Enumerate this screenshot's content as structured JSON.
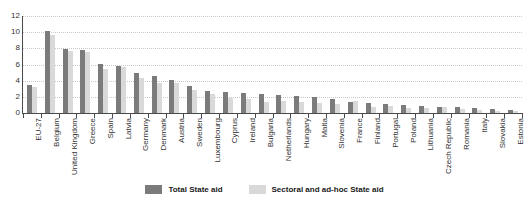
{
  "chart_data": {
    "type": "bar",
    "title": "",
    "xlabel": "",
    "ylabel": "",
    "ylim": [
      0,
      12
    ],
    "yticks": [
      0,
      2,
      4,
      6,
      8,
      10,
      12
    ],
    "grid": true,
    "legend_position": "bottom-center",
    "categories": [
      "EU-27",
      "Belgium",
      "United Kingdom",
      "Greece",
      "Spain",
      "Latvia",
      "Germany",
      "Denmark",
      "Austria",
      "Sweden",
      "Luxembourg",
      "Cyprus",
      "Ireland",
      "Bulgaria",
      "Netherlands",
      "Hungary",
      "Malta",
      "Slovenia",
      "France",
      "Finland",
      "Portugal",
      "Poland",
      "Lithuania",
      "Czech Republic",
      "Romania",
      "Italy",
      "Slovakia",
      "Estonia"
    ],
    "series": [
      {
        "name": "Total State aid",
        "color": "#7b7b7b",
        "values": [
          3.5,
          10.1,
          7.9,
          7.8,
          6.1,
          5.8,
          4.9,
          4.6,
          4.1,
          3.3,
          2.7,
          2.6,
          2.5,
          2.4,
          2.2,
          2.1,
          2.0,
          1.7,
          1.4,
          1.2,
          1.1,
          1.0,
          0.9,
          0.8,
          0.7,
          0.6,
          0.5,
          0.4
        ]
      },
      {
        "name": "Sectoral and ad-hoc State aid",
        "color": "#d9d9d9",
        "values": [
          3.2,
          9.6,
          7.7,
          7.5,
          5.4,
          5.7,
          4.3,
          3.7,
          3.7,
          2.9,
          2.3,
          1.8,
          1.7,
          1.4,
          1.5,
          1.4,
          1.3,
          1.1,
          1.5,
          0.8,
          0.9,
          0.6,
          0.6,
          0.7,
          0.5,
          0.4,
          0.3,
          0.2
        ]
      }
    ]
  },
  "legend": {
    "items": [
      {
        "label": "Total State aid",
        "color": "#7b7b7b"
      },
      {
        "label": "Sectoral and ad-hoc State aid",
        "color": "#d9d9d9"
      }
    ]
  }
}
